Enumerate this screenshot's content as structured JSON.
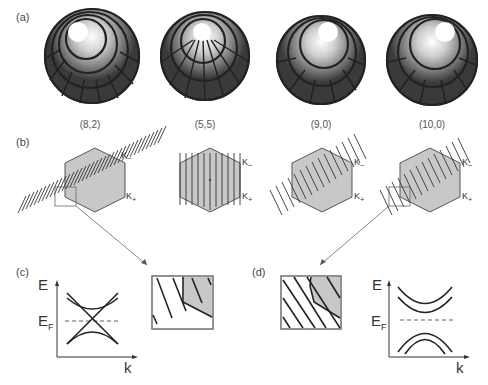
{
  "figure": {
    "panels": {
      "a": {
        "label": "(a)",
        "tubes": [
          {
            "chirality": "(8,2)"
          },
          {
            "chirality": "(5,5)"
          },
          {
            "chirality": "(9,0)"
          },
          {
            "chirality": "(10,0)"
          }
        ]
      },
      "b": {
        "label": "(b)",
        "k_minus": "K",
        "k_minus_sub": "−",
        "k_plus": "K",
        "k_plus_sub": "+"
      },
      "c": {
        "label": "(c)",
        "y_axis": "E",
        "fermi": "E",
        "fermi_sub": "F",
        "x_axis": "k",
        "type": "metallic"
      },
      "d": {
        "label": "(d)",
        "y_axis": "E",
        "fermi": "E",
        "fermi_sub": "F",
        "x_axis": "k",
        "type": "semiconducting"
      }
    }
  }
}
